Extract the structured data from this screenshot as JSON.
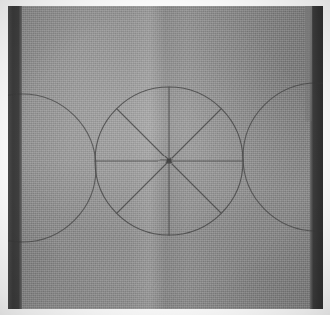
{
  "scene": {
    "title": "Pencil circle construction on gray woven fabric",
    "subject": "geometric circle layout drawn on cloth",
    "surface_label": "gray woven fabric",
    "medium_label": "pencil line drawing",
    "alt_text": "Photograph of a square of gray woven fabric with three overlapping circles drawn on it; the central circle is divided into eight equal sectors by two diameters and two diagonals, flanked by a partial circle on the left and on the right."
  },
  "canvas": {
    "width": 330,
    "height": 315,
    "border_label": "white photo border",
    "border_color": "#fdfdfd"
  },
  "fabric": {
    "label": "fabric panel",
    "left": 8,
    "top": 6,
    "width": 315,
    "height": 303,
    "base_color": "#8f8f8f",
    "highlight_color": "#9a9a9a",
    "shadow_color": "#808080",
    "weave_label": "plain-weave texture"
  },
  "shadow_bands": [
    {
      "name": "left-shadow-band",
      "label": "left dark edge band",
      "side": "left",
      "width": 14,
      "color": "#3b3b3b"
    },
    {
      "name": "right-shadow-band",
      "label": "right dark edge band",
      "side": "right",
      "width": 13,
      "color": "#343434"
    }
  ],
  "drawing": {
    "label": "circle construction drawing",
    "line_color": "#3a3a3a",
    "line_width": 1.1,
    "center_dot_label": "center point",
    "shapes": [
      {
        "name": "center-circle",
        "label": "central circle",
        "type": "circle",
        "cx": 169,
        "cy": 161,
        "r": 74
      },
      {
        "name": "left-circle",
        "label": "left circle (partial, tangent at left)",
        "type": "circle",
        "cx": 22,
        "cy": 168,
        "r": 74
      },
      {
        "name": "right-circle",
        "label": "right circle (partial, tangent at right)",
        "type": "circle",
        "cx": 317,
        "cy": 157,
        "r": 74
      }
    ],
    "diameters": [
      {
        "name": "vertical-diameter",
        "label": "vertical diameter",
        "x1": 169,
        "y1": 87,
        "x2": 169,
        "y2": 235,
        "angle_deg": 90
      },
      {
        "name": "horizontal-diameter",
        "label": "horizontal diameter",
        "x1": 95,
        "y1": 161,
        "x2": 243,
        "y2": 161,
        "angle_deg": 0
      },
      {
        "name": "diagonal-diameter-nw-se",
        "label": "diagonal diameter (upper-left to lower-right)",
        "x1": 117,
        "y1": 109,
        "x2": 221,
        "y2": 213,
        "angle_deg": 45
      },
      {
        "name": "diagonal-diameter-ne-sw",
        "label": "diagonal diameter (upper-right to lower-left)",
        "x1": 221,
        "y1": 109,
        "x2": 117,
        "y2": 213,
        "angle_deg": 135
      }
    ],
    "sector_count": 8,
    "sector_angle_deg": 45
  }
}
